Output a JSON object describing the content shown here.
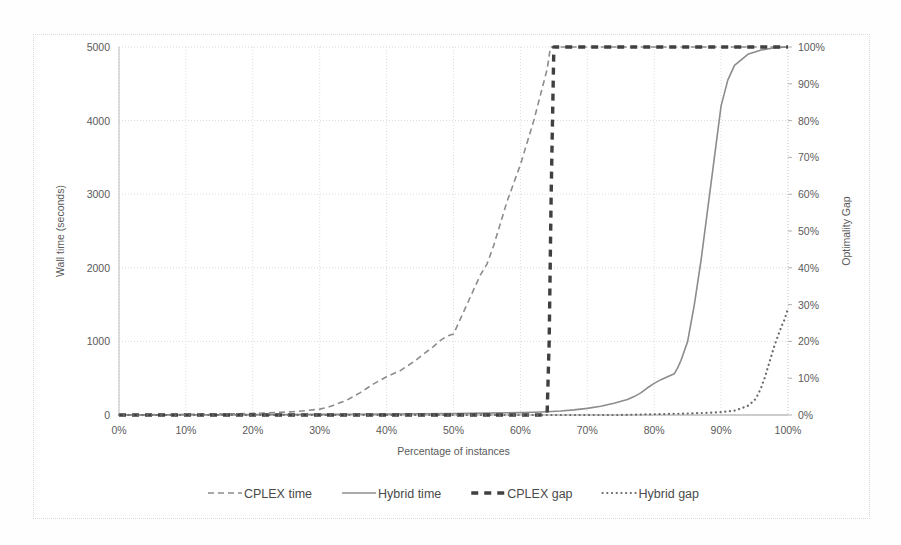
{
  "chart_data": {
    "type": "line",
    "title": "",
    "xlabel": "Percentage of instances",
    "ylabel": "Wall time (seconds)",
    "y2label": "Optimality Gap",
    "xlim": [
      0,
      100
    ],
    "ylim": [
      0,
      5000
    ],
    "y2lim": [
      0,
      100
    ],
    "grid": true,
    "legend_position": "bottom",
    "xticks": [
      "0%",
      "10%",
      "20%",
      "30%",
      "40%",
      "50%",
      "60%",
      "70%",
      "80%",
      "90%",
      "100%"
    ],
    "xtick_values": [
      0,
      10,
      20,
      30,
      40,
      50,
      60,
      70,
      80,
      90,
      100
    ],
    "yticks": [
      "0",
      "1000",
      "2000",
      "3000",
      "4000",
      "5000"
    ],
    "ytick_values": [
      0,
      1000,
      2000,
      3000,
      4000,
      5000
    ],
    "y2ticks": [
      "0%",
      "10%",
      "20%",
      "30%",
      "40%",
      "50%",
      "60%",
      "70%",
      "80%",
      "90%",
      "100%"
    ],
    "y2tick_values": [
      0,
      10,
      20,
      30,
      40,
      50,
      60,
      70,
      80,
      90,
      100
    ],
    "series": [
      {
        "name": "CPLEX time",
        "axis": "left",
        "style": "dashed",
        "color": "#8c8c8c",
        "width": 1.6,
        "x": [
          0,
          2,
          4,
          6,
          8,
          10,
          12,
          14,
          16,
          18,
          20,
          22,
          24,
          26,
          28,
          30,
          31,
          32,
          33,
          34,
          35,
          36,
          37,
          38,
          39,
          40,
          41,
          42,
          43,
          44,
          45,
          46,
          47,
          48,
          49,
          50,
          51,
          52,
          53,
          54,
          55,
          56,
          57,
          58,
          59,
          60,
          61,
          62,
          63,
          64,
          64.5,
          65,
          70,
          80,
          90,
          100
        ],
        "y": [
          2,
          3,
          4,
          5,
          6,
          8,
          10,
          12,
          15,
          18,
          22,
          28,
          35,
          45,
          60,
          80,
          100,
          130,
          165,
          200,
          250,
          300,
          360,
          420,
          470,
          520,
          560,
          600,
          660,
          720,
          790,
          860,
          930,
          1010,
          1070,
          1100,
          1300,
          1500,
          1700,
          1900,
          2050,
          2300,
          2600,
          2900,
          3150,
          3400,
          3700,
          4000,
          4350,
          4700,
          5000,
          5000,
          5000,
          5000,
          5000,
          5000
        ]
      },
      {
        "name": "Hybrid time",
        "axis": "left",
        "style": "solid",
        "color": "#8c8c8c",
        "width": 1.6,
        "x": [
          0,
          5,
          10,
          15,
          20,
          25,
          30,
          35,
          40,
          45,
          50,
          55,
          60,
          62,
          64,
          66,
          68,
          70,
          72,
          74,
          76,
          77,
          78,
          79,
          80,
          81,
          82,
          83,
          83.5,
          84,
          84.5,
          85,
          85.5,
          86,
          86.5,
          87,
          87.5,
          88,
          88.5,
          89,
          89.5,
          90,
          91,
          92,
          94,
          96,
          98,
          100
        ],
        "y": [
          1,
          2,
          3,
          4,
          5,
          6,
          8,
          10,
          13,
          16,
          20,
          25,
          32,
          38,
          45,
          55,
          70,
          90,
          120,
          160,
          210,
          250,
          300,
          370,
          430,
          480,
          520,
          560,
          640,
          740,
          870,
          1000,
          1250,
          1500,
          1800,
          2100,
          2450,
          2800,
          3150,
          3500,
          3850,
          4200,
          4550,
          4750,
          4900,
          4960,
          4990,
          5000
        ]
      },
      {
        "name": "CPLEX gap",
        "axis": "right",
        "style": "thick-dashed",
        "color": "#404040",
        "width": 3.4,
        "x": [
          0,
          10,
          20,
          30,
          40,
          50,
          60,
          63,
          64,
          64.3,
          64.6,
          65,
          70,
          80,
          90,
          100
        ],
        "y": [
          0,
          0,
          0,
          0,
          0,
          0,
          0,
          0,
          0.5,
          20,
          60,
          100,
          100,
          100,
          100,
          100
        ]
      },
      {
        "name": "Hybrid gap",
        "axis": "right",
        "style": "dotted",
        "color": "#6a6a6a",
        "width": 2.2,
        "x": [
          0,
          5,
          10,
          15,
          20,
          25,
          30,
          35,
          40,
          45,
          50,
          55,
          60,
          65,
          70,
          75,
          80,
          85,
          88,
          90,
          92,
          93,
          94,
          95,
          95.5,
          96,
          96.5,
          97,
          97.5,
          98,
          98.5,
          99,
          99.5,
          100
        ],
        "y": [
          0,
          0,
          0,
          0,
          0,
          0,
          0,
          0,
          0,
          0,
          0,
          0,
          0,
          0,
          0,
          0,
          0.2,
          0.4,
          0.6,
          0.8,
          1.2,
          1.8,
          2.5,
          4.0,
          5.5,
          7.5,
          10.0,
          13.0,
          16.0,
          19.0,
          21.5,
          24.0,
          26.0,
          29.0
        ]
      }
    ],
    "legend": [
      {
        "label": "CPLEX time",
        "style": "dashed",
        "color": "#8c8c8c"
      },
      {
        "label": "Hybrid time",
        "style": "solid",
        "color": "#8c8c8c"
      },
      {
        "label": "CPLEX gap",
        "style": "thick-dashed",
        "color": "#404040"
      },
      {
        "label": "Hybrid gap",
        "style": "dotted",
        "color": "#6a6a6a"
      }
    ]
  }
}
